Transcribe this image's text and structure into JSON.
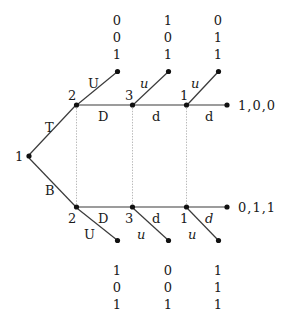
{
  "figure": {
    "type": "trellis-diagram",
    "background": "#ffffff",
    "ink_color": "#1a1a1a",
    "guide_color": "#b9b9b9"
  },
  "root": {
    "state_label": "1",
    "x": 27,
    "y": 156
  },
  "branch_labels": {
    "top": "T",
    "bottom": "B"
  },
  "top_path": {
    "states": [
      "2",
      "3",
      "1"
    ],
    "edge_labels": [
      "D",
      "d",
      "d"
    ],
    "up_edge_labels": [
      "U",
      "u",
      "u"
    ],
    "output_word": "1,0,0",
    "bit_triplets": [
      [
        "0",
        "0",
        "1"
      ],
      [
        "1",
        "0",
        "1"
      ],
      [
        "0",
        "1",
        "1"
      ]
    ]
  },
  "bottom_path": {
    "states": [
      "2",
      "3",
      "1"
    ],
    "edge_labels": [
      "D",
      "d",
      "d"
    ],
    "down_edge_labels": [
      "U",
      "u",
      "u"
    ],
    "output_word": "0,1,1",
    "bit_triplets": [
      [
        "1",
        "0",
        "1"
      ],
      [
        "0",
        "0",
        "1"
      ],
      [
        "1",
        "1",
        "1"
      ]
    ]
  }
}
